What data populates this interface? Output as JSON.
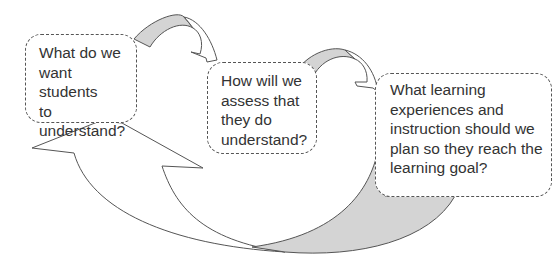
{
  "diagram": {
    "type": "cycle",
    "boxes": [
      {
        "id": "box1",
        "text": "What do we want students to understand?",
        "lines": [
          "What do we",
          "want students",
          "to",
          "understand?"
        ]
      },
      {
        "id": "box2",
        "text": "How will we assess that they do understand?",
        "lines": [
          "How will we",
          "assess that",
          "they do",
          "understand?"
        ]
      },
      {
        "id": "box3",
        "text": "What learning experiences and instruction should we plan so they reach the learning goal?",
        "lines": [
          "What learning",
          "experiences and",
          "instruction should we",
          "plan so they reach the",
          "learning goal?"
        ]
      }
    ],
    "arrows": [
      {
        "from": "box1",
        "to": "box2",
        "style": "curved-small"
      },
      {
        "from": "box2",
        "to": "box3",
        "style": "curved-small"
      },
      {
        "from": "box3",
        "to": "box1",
        "style": "curved-large"
      },
      {
        "from": "box3",
        "to": "box2",
        "style": "curved-large"
      }
    ],
    "colors": {
      "stroke": "#555555",
      "shade": "#d4d4d4",
      "fill": "#ffffff",
      "text": "#333333"
    }
  }
}
